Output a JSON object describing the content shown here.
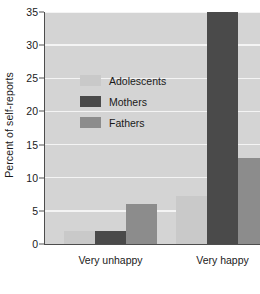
{
  "chart_data": {
    "type": "bar",
    "title": "",
    "xlabel": "",
    "ylabel": "Percent of self-reports",
    "categories": [
      "Very unhappy",
      "Very happy"
    ],
    "series": [
      {
        "name": "Adolescents",
        "values": [
          2.0,
          7.2
        ],
        "color": "#c9c9c9"
      },
      {
        "name": "Mothers",
        "values": [
          2.0,
          35.0
        ],
        "color": "#4a4a4a"
      },
      {
        "name": "Fathers",
        "values": [
          6.0,
          13.0
        ],
        "color": "#8c8c8c"
      }
    ],
    "ylim": [
      0,
      35
    ],
    "yticks": [
      0,
      5,
      10,
      15,
      20,
      25,
      30,
      35
    ],
    "ytick_labels": [
      "0",
      "5",
      "10",
      "15",
      "20",
      "25",
      "30",
      "35"
    ],
    "grid": true,
    "grid_color": "#f4f4f4",
    "plot_background": "#d4d4d4",
    "legend_position": "upper-left-inside"
  },
  "legend": {
    "entries": [
      {
        "label": "Adolescents"
      },
      {
        "label": "Mothers"
      },
      {
        "label": "Fathers"
      }
    ]
  },
  "axis": {
    "y_title": "Percent of self-reports",
    "x_labels": [
      "Very unhappy",
      "Very happy"
    ],
    "y_labels": [
      "0",
      "5",
      "10",
      "15",
      "20",
      "25",
      "30",
      "35"
    ]
  }
}
